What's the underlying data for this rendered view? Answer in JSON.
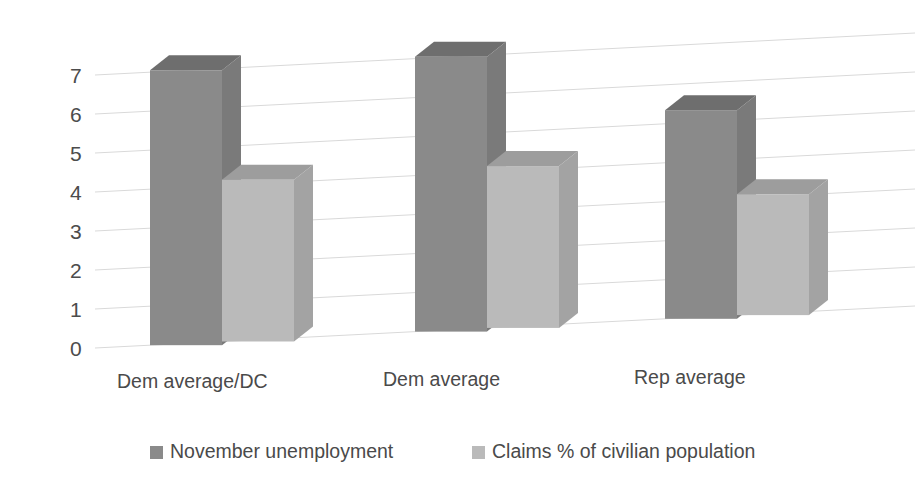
{
  "chart_data": {
    "type": "bar",
    "title": "",
    "subtitle": "",
    "xlabel": "",
    "ylabel": "",
    "categories": [
      "Dem average/DC",
      "Dem average",
      "Rep average"
    ],
    "series": [
      {
        "name": "November unemployment",
        "color": "#8a8a8a",
        "values": [
          7.05,
          7.05,
          5.35
        ]
      },
      {
        "name": "Claims % of civilian population",
        "color": "#bababa",
        "values": [
          4.15,
          4.15,
          3.1
        ]
      }
    ],
    "yticks": [
      0,
      1,
      2,
      3,
      4,
      5,
      6,
      7
    ],
    "ylim": [
      0,
      7.6
    ],
    "grid": true,
    "grid_axis": "y",
    "legend_position": "bottom",
    "three_d": true,
    "style": {
      "grid_color": "#d9d9d9",
      "tick_label_color": "#4c4c4c",
      "category_label_color": "#4a4a4a",
      "legend_label_color": "#4a4a4a",
      "background": "#ffffff",
      "series_top_colors": [
        "#6e6e6e",
        "#9d9d9d"
      ],
      "series_side_colors": [
        "#7a7a7a",
        "#a3a3a3"
      ]
    }
  },
  "axis": {
    "ytick_labels": [
      "7",
      "6",
      "5",
      "4",
      "3",
      "2",
      "1",
      "0"
    ]
  },
  "legend": {
    "items": [
      {
        "label": "November unemployment"
      },
      {
        "label": "Claims % of civilian population"
      }
    ]
  }
}
